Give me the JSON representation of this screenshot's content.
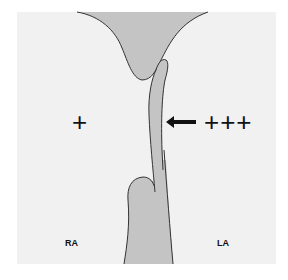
{
  "diagram": {
    "labels": {
      "right_atrium": "RA",
      "left_atrium": "LA"
    },
    "pressure": {
      "right": "+",
      "left": "+++"
    },
    "colors": {
      "background_panel": "#f1f1f1",
      "tissue_fill": "#c4c4c4",
      "outline": "#333333",
      "arrow": "#111111"
    },
    "arrow": {
      "direction": "left"
    }
  }
}
